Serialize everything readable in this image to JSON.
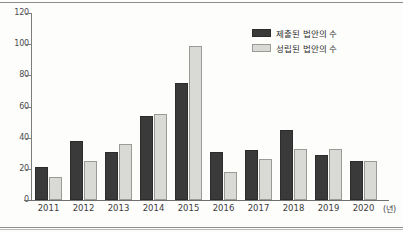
{
  "chart_data": {
    "type": "bar",
    "title": "",
    "xlabel": "(년)",
    "ylabel": "",
    "ylim": [
      0,
      120
    ],
    "yticks": [
      0,
      20,
      40,
      60,
      80,
      100,
      120
    ],
    "grid": false,
    "legend_position": "top-right",
    "categories": [
      "2011",
      "2012",
      "2013",
      "2014",
      "2015",
      "2016",
      "2017",
      "2018",
      "2019",
      "2020"
    ],
    "series": [
      {
        "name": "제출된 법안의 수",
        "color": "#3a3a3a",
        "values": [
          21,
          38,
          31,
          54,
          75,
          31,
          32,
          45,
          29,
          25
        ]
      },
      {
        "name": "성립된 법안의 수",
        "color": "#d9d9d6",
        "values": [
          15,
          25,
          36,
          55,
          99,
          18,
          26,
          33,
          33,
          25
        ]
      }
    ]
  },
  "axis": {
    "unit_label": "(년)"
  }
}
